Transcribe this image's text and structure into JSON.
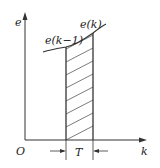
{
  "diagram": {
    "axes": {
      "y_label": "e",
      "x_label": "k",
      "origin_label": "O"
    },
    "curve_labels": {
      "left": "e(k−1)",
      "right": "e(k)"
    },
    "interval_label": "T",
    "colors": {
      "stroke": "#333333",
      "background": "#ffffff"
    }
  }
}
